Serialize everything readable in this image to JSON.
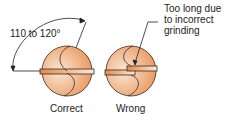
{
  "angle_label": "110 to 120°",
  "annotation": [
    "Too long due",
    "to incorrect",
    "grinding"
  ],
  "captions": {
    "correct": "Correct",
    "wrong": "Wrong"
  },
  "colors": {
    "fill_dark": "#e8955a",
    "fill_light": "#fbe6d6",
    "stroke": "#3a2a20"
  }
}
